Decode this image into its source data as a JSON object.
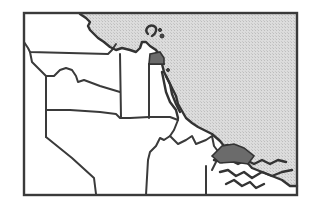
{
  "map": {
    "title": "Regional boundary map with coastline",
    "colors": {
      "sea": "#d6d6d6",
      "land": "#ffffff",
      "border": "#3a3a3a",
      "highlight": "#6b6b6b"
    },
    "regions": [
      {
        "id": "northwest",
        "label": "",
        "highlighted": false
      },
      {
        "id": "west-strip",
        "label": "",
        "highlighted": false
      },
      {
        "id": "central-north",
        "label": "",
        "highlighted": false
      },
      {
        "id": "central",
        "label": "",
        "highlighted": false
      },
      {
        "id": "north-narrow",
        "label": "",
        "highlighted": false
      },
      {
        "id": "southwest",
        "label": "",
        "highlighted": false
      },
      {
        "id": "south-central",
        "label": "",
        "highlighted": false
      },
      {
        "id": "southeast-peninsula",
        "label": "",
        "highlighted": false
      },
      {
        "id": "highlight-north",
        "label": "",
        "highlighted": true
      },
      {
        "id": "highlight-southeast",
        "label": "",
        "highlighted": true
      }
    ],
    "legend": []
  }
}
